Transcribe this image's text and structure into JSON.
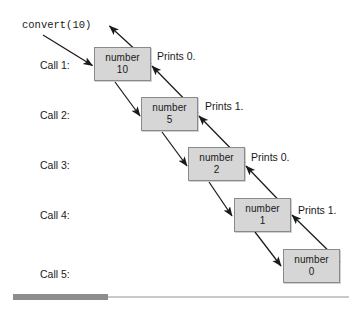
{
  "figure": {
    "entry_call": "convert(10)",
    "box_label": "number",
    "colors": {
      "box_fill": "#d6d6d6",
      "box_border": "#8a8a8a",
      "arrow": "#1a1a1a",
      "text": "#1a1a1a",
      "scroll_thumb": "#8d8d8d",
      "scroll_track": "#c9c9c9",
      "background": "#ffffff"
    },
    "calls": [
      {
        "call_label": "Call 1:",
        "var_name": "number",
        "value": "10",
        "prints": "Prints 0."
      },
      {
        "call_label": "Call 2:",
        "var_name": "number",
        "value": "5",
        "prints": "Prints 1."
      },
      {
        "call_label": "Call 3:",
        "var_name": "number",
        "value": "2",
        "prints": "Prints 0."
      },
      {
        "call_label": "Call 4:",
        "var_name": "number",
        "value": "1",
        "prints": "Prints 1."
      },
      {
        "call_label": "Call 5:",
        "var_name": "number",
        "value": "0",
        "prints": ""
      }
    ]
  },
  "scrollbar": {
    "orientation": "horizontal",
    "thumb_position": "left"
  }
}
